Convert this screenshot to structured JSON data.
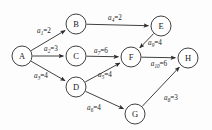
{
  "diagram": {
    "type": "directed-network-aoe",
    "colors": {
      "stroke": "#2b2b2b",
      "node_fill": "#ffffff",
      "background": "#fdfdfd",
      "text": "#1a1a1a"
    },
    "nodes": [
      {
        "id": "A",
        "label": "A",
        "x": 22,
        "y": 56,
        "r": 10
      },
      {
        "id": "B",
        "label": "B",
        "x": 76,
        "y": 24,
        "r": 10
      },
      {
        "id": "C",
        "label": "C",
        "x": 76,
        "y": 56,
        "r": 10
      },
      {
        "id": "D",
        "label": "D",
        "x": 76,
        "y": 87,
        "r": 10
      },
      {
        "id": "E",
        "label": "E",
        "x": 161,
        "y": 26,
        "r": 10
      },
      {
        "id": "F",
        "label": "F",
        "x": 131,
        "y": 57,
        "r": 10
      },
      {
        "id": "G",
        "label": "G",
        "x": 135,
        "y": 114,
        "r": 10
      },
      {
        "id": "H",
        "label": "H",
        "x": 188,
        "y": 58,
        "r": 10
      }
    ],
    "edges": [
      {
        "id": "a1",
        "from": "A",
        "to": "B",
        "name": "a",
        "sub": "1",
        "eq": "=",
        "weight": "2",
        "label_x": 44,
        "label_y": 31
      },
      {
        "id": "a2",
        "from": "A",
        "to": "C",
        "name": "a",
        "sub": "2",
        "eq": "=",
        "weight": "3",
        "label_x": 51,
        "label_y": 49
      },
      {
        "id": "a3",
        "from": "A",
        "to": "D",
        "name": "a",
        "sub": "3",
        "eq": "=",
        "weight": "4",
        "label_x": 41,
        "label_y": 76
      },
      {
        "id": "a4",
        "from": "B",
        "to": "E",
        "name": "a",
        "sub": "4",
        "eq": "=",
        "weight": "2",
        "label_x": 115,
        "label_y": 18
      },
      {
        "id": "a9",
        "from": "E",
        "to": "F",
        "name": "a",
        "sub": "9",
        "eq": "=",
        "weight": "4",
        "label_x": 155,
        "label_y": 43
      },
      {
        "id": "a7",
        "from": "C",
        "to": "F",
        "name": "a",
        "sub": "7",
        "eq": "=",
        "weight": "6",
        "label_x": 101,
        "label_y": 51
      },
      {
        "id": "a5",
        "from": "D",
        "to": "F",
        "name": "a",
        "sub": "5",
        "eq": "=",
        "weight": "4",
        "label_x": 105,
        "label_y": 75
      },
      {
        "id": "a6",
        "from": "D",
        "to": "G",
        "name": "a",
        "sub": "6",
        "eq": "=",
        "weight": "4",
        "label_x": 94,
        "label_y": 108
      },
      {
        "id": "a10",
        "from": "F",
        "to": "H",
        "name": "a",
        "sub": "10",
        "eq": "=",
        "weight": "6",
        "label_x": 159,
        "label_y": 64
      },
      {
        "id": "a8",
        "from": "G",
        "to": "H",
        "name": "a",
        "sub": "8",
        "eq": "=",
        "weight": "3",
        "label_x": 171,
        "label_y": 98
      }
    ]
  }
}
